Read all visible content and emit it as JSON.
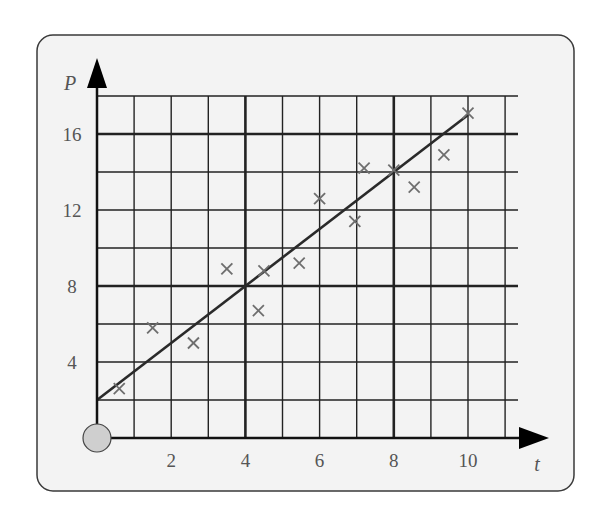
{
  "chart_data": {
    "type": "scatter",
    "title": "",
    "xlabel": "t",
    "ylabel": "P",
    "xlim": [
      0,
      11
    ],
    "ylim": [
      0,
      18
    ],
    "x_ticks": [
      2,
      4,
      6,
      8,
      10
    ],
    "y_ticks": [
      4,
      8,
      12,
      16
    ],
    "x_tick_labels": [
      "2",
      "4",
      "6",
      "8",
      "10"
    ],
    "y_tick_labels": [
      "4",
      "8",
      "12",
      "16"
    ],
    "grid": true,
    "grid_minor_step_x": 1,
    "grid_minor_step_y": 2,
    "grid_major_step_x": 4,
    "grid_major_step_y": 8,
    "legend": null,
    "marker": "x",
    "points": [
      {
        "t": 0.6,
        "P": 2.6
      },
      {
        "t": 1.5,
        "P": 5.8
      },
      {
        "t": 2.6,
        "P": 5.0
      },
      {
        "t": 3.5,
        "P": 8.9
      },
      {
        "t": 4.35,
        "P": 6.7
      },
      {
        "t": 4.5,
        "P": 8.8
      },
      {
        "t": 5.45,
        "P": 9.2
      },
      {
        "t": 6.0,
        "P": 12.6
      },
      {
        "t": 6.95,
        "P": 11.4
      },
      {
        "t": 7.2,
        "P": 14.2
      },
      {
        "t": 8.0,
        "P": 14.1
      },
      {
        "t": 8.55,
        "P": 13.2
      },
      {
        "t": 9.35,
        "P": 14.9
      },
      {
        "t": 10.0,
        "P": 17.1
      }
    ],
    "series": [
      {
        "name": "line of best fit",
        "type": "line",
        "x": [
          0,
          10
        ],
        "y": [
          2,
          17
        ],
        "equation": "P = 2 + 1.5t"
      }
    ]
  },
  "colors": {
    "panel_bg": "#f3f3f3",
    "panel_border": "#3a3a3a",
    "grid": "#222222",
    "marker": "#6e6e6e",
    "line": "#2a2a2a",
    "origin_circle_fill": "#cfcfcf",
    "label": "#555555"
  }
}
